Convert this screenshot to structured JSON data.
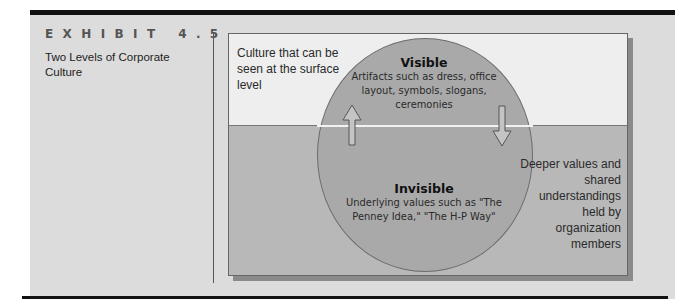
{
  "exhibit": {
    "label": "EXHIBIT 4.5",
    "title": "Two Levels of Corporate Culture"
  },
  "diagram": {
    "surface_description": "Culture that can be seen at the surface level",
    "visible": {
      "heading": "Visible",
      "body": "Artifacts such as dress, office layout, symbols, slogans, ceremonies"
    },
    "invisible": {
      "heading": "Invisible",
      "body": "Underlying values such as \"The Penney Idea,\" \"The H-P Way\""
    },
    "deeper_description": "Deeper values and shared understandings held by organization members",
    "arrows": {
      "up": "arrow-up-icon",
      "down": "arrow-down-icon"
    }
  },
  "colors": {
    "panel_bg": "#dcdcdc",
    "rule": "#111111",
    "upper_region": "#eeeeee",
    "lower_region": "#b8b8b8",
    "circle": "#a9a9a9",
    "shadow": "#8a8a8a"
  }
}
